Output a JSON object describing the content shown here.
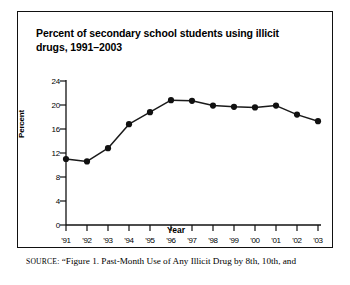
{
  "figure": {
    "title": "Percent of secondary school students using illicit drugs, 1991–2003",
    "source_keyword": "SOURCE:",
    "source_text": "“Figure 1. Past-Month Use of Any Illicit Drug by 8th, 10th, and"
  },
  "chart_data": {
    "type": "line",
    "title": "Percent of secondary school students using illicit drugs, 1991–2003",
    "xlabel": "Year",
    "ylabel": "Percent",
    "categories": [
      "'91",
      "'92",
      "'93",
      "'94",
      "'95",
      "'96",
      "'97",
      "'98",
      "'99",
      "'00",
      "'01",
      "'02",
      "'03"
    ],
    "values": [
      11.0,
      10.6,
      12.8,
      16.8,
      18.8,
      20.8,
      20.7,
      19.9,
      19.7,
      19.6,
      19.9,
      18.4,
      17.3
    ],
    "ylim": [
      0,
      24
    ],
    "yticks": [
      0,
      4,
      8,
      12,
      16,
      20,
      24
    ],
    "ytick_labels": [
      "0",
      "4",
      "8",
      "12",
      "16",
      "20",
      "24"
    ],
    "grid": false,
    "legend": false,
    "marker": "filled-circle",
    "line_color": "#1a1a1a",
    "marker_color": "#111111"
  }
}
